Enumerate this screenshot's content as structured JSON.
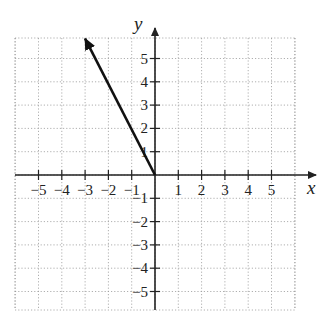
{
  "chart_data": {
    "type": "line",
    "title": "",
    "xlabel": "x",
    "ylabel": "y",
    "xlim": [
      -6,
      6
    ],
    "ylim": [
      -6,
      6
    ],
    "grid": true,
    "grid_style": "dotted",
    "x_ticks": [
      -5,
      -4,
      -3,
      -2,
      -1,
      1,
      2,
      3,
      4,
      5
    ],
    "y_ticks": [
      -5,
      -4,
      -3,
      -2,
      -1,
      1,
      2,
      3,
      4,
      5
    ],
    "x_tick_labels": [
      "−5",
      "−4",
      "−3",
      "−2",
      "−1",
      "1",
      "2",
      "3",
      "4",
      "5"
    ],
    "y_tick_labels": [
      "−5",
      "−4",
      "−3",
      "−2",
      "−1",
      "1",
      "2",
      "3",
      "4",
      "5"
    ],
    "series": [
      {
        "name": "vector",
        "kind": "arrow",
        "start": [
          0,
          0
        ],
        "end": [
          -3,
          5.85
        ],
        "color": "#111111"
      }
    ],
    "legend": null
  },
  "layout": {
    "origin_px": [
      155,
      175
    ],
    "unit_px": 23.3,
    "grid_left": 15,
    "grid_right": 295,
    "grid_top": 38,
    "grid_bottom": 310,
    "x_axis_end": 316,
    "y_axis_top": 28,
    "colors": {
      "axis": "#222222",
      "grid": "#9a9a9a",
      "vector": "#111111",
      "text": "#222222"
    }
  }
}
